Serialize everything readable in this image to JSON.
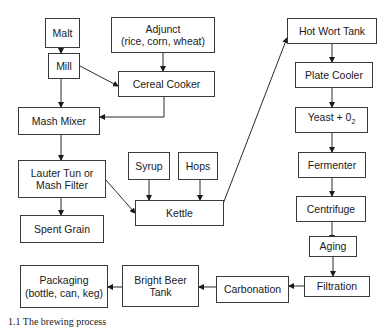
{
  "diagram": {
    "type": "flowchart",
    "nodes": {
      "malt": {
        "label": "Malt"
      },
      "mill": {
        "label": "Mill"
      },
      "adjunct": {
        "line1": "Adjunct",
        "line2": "(rice, corn, wheat)"
      },
      "cereal_cooker": {
        "label": "Cereal Cooker"
      },
      "mash_mixer": {
        "label": "Mash Mixer"
      },
      "lauter_tun": {
        "line1": "Lauter Tun or",
        "line2": "Mash Filter"
      },
      "spent_grain": {
        "label": "Spent Grain"
      },
      "syrup": {
        "label": "Syrup"
      },
      "hops": {
        "label": "Hops"
      },
      "kettle": {
        "label": "Kettle"
      },
      "hot_wort_tank": {
        "label": "Hot Wort Tank"
      },
      "plate_cooler": {
        "label": "Plate Cooler"
      },
      "yeast_o2": {
        "label": "Yeast + 0",
        "sub": "2"
      },
      "fermenter": {
        "label": "Fermenter"
      },
      "centrifuge": {
        "label": "Centrifuge"
      },
      "aging": {
        "label": "Aging"
      },
      "filtration": {
        "label": "Filtration"
      },
      "carbonation": {
        "label": "Carbonation"
      },
      "bright_beer_tank": {
        "line1": "Bright Beer",
        "line2": "Tank"
      },
      "packaging": {
        "line1": "Packaging",
        "line2": "(bottle, can, keg)"
      }
    },
    "edges": [
      [
        "Malt",
        "Mill"
      ],
      [
        "Mill",
        "Mash Mixer"
      ],
      [
        "Mill",
        "Cereal Cooker"
      ],
      [
        "Adjunct",
        "Cereal Cooker"
      ],
      [
        "Cereal Cooker",
        "Mash Mixer"
      ],
      [
        "Mash Mixer",
        "Lauter Tun or Mash Filter"
      ],
      [
        "Lauter Tun or Mash Filter",
        "Spent Grain"
      ],
      [
        "Lauter Tun or Mash Filter",
        "Kettle"
      ],
      [
        "Syrup",
        "Kettle"
      ],
      [
        "Hops",
        "Kettle"
      ],
      [
        "Kettle",
        "Hot Wort Tank"
      ],
      [
        "Hot Wort Tank",
        "Plate Cooler"
      ],
      [
        "Plate Cooler",
        "Yeast + O2"
      ],
      [
        "Yeast + O2",
        "Fermenter"
      ],
      [
        "Fermenter",
        "Centrifuge"
      ],
      [
        "Centrifuge",
        "Aging"
      ],
      [
        "Aging",
        "Filtration"
      ],
      [
        "Filtration",
        "Carbonation"
      ],
      [
        "Carbonation",
        "Bright Beer Tank"
      ],
      [
        "Bright Beer Tank",
        "Packaging"
      ]
    ],
    "caption": "1.1 The brewing process"
  }
}
